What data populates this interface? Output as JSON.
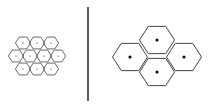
{
  "diagram": {
    "colors": {
      "stroke": "#444444",
      "divider": "#333333",
      "dot": "#111111",
      "background": "#ffffff"
    },
    "left_cluster": {
      "label": "small-cells",
      "hex_radius": 7.6,
      "cells": [
        {
          "cx": 23,
          "cy": 43
        },
        {
          "cx": 37,
          "cy": 43
        },
        {
          "cx": 51,
          "cy": 43
        },
        {
          "cx": 16,
          "cy": 56
        },
        {
          "cx": 30,
          "cy": 56
        },
        {
          "cx": 44,
          "cy": 56
        },
        {
          "cx": 58,
          "cy": 56
        },
        {
          "cx": 23,
          "cy": 69
        },
        {
          "cx": 37,
          "cy": 69
        },
        {
          "cx": 51,
          "cy": 69
        }
      ],
      "dot_radius": 0.6
    },
    "divider": {
      "x": 88,
      "y1": 7,
      "y2": 101
    },
    "right_cluster": {
      "label": "large-cells",
      "hex_radius": 17.5,
      "cells": [
        {
          "cx": 157,
          "cy": 40
        },
        {
          "cx": 130,
          "cy": 57
        },
        {
          "cx": 184,
          "cy": 57
        },
        {
          "cx": 157,
          "cy": 72
        }
      ],
      "dot_radius": 1.6
    }
  }
}
